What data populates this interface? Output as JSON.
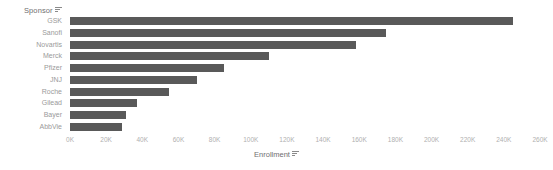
{
  "chart_data": {
    "type": "bar",
    "orientation": "horizontal",
    "title": "",
    "xlabel": "Enrollment",
    "ylabel": "Sponsor",
    "categories": [
      "GSK",
      "Sanofi",
      "Novartis",
      "Merck",
      "Pfizer",
      "JNJ",
      "Roche",
      "Gilead",
      "Bayer",
      "AbbVie"
    ],
    "values": [
      245000,
      175000,
      158000,
      110000,
      85000,
      70000,
      55000,
      37000,
      31000,
      29000
    ],
    "value_labels": [
      "245K",
      "175K",
      "158K",
      "110K",
      "85K",
      "70K",
      "55K",
      "37K",
      "31K",
      "29K"
    ],
    "xlim": [
      0,
      260000
    ],
    "xticks": [
      0,
      20000,
      40000,
      60000,
      80000,
      100000,
      120000,
      140000,
      160000,
      180000,
      200000,
      220000,
      240000,
      260000
    ],
    "xticklabels": [
      "0K",
      "20K",
      "40K",
      "60K",
      "80K",
      "100K",
      "120K",
      "140K",
      "160K",
      "180K",
      "200K",
      "220K",
      "240K",
      "260K"
    ],
    "grid": false,
    "legend": null,
    "bar_color": "#595959",
    "background_color": "#ffffff"
  },
  "axes": {
    "y": {
      "title": "Sponsor",
      "sort_icon": "sort-icon"
    },
    "x": {
      "title": "Enrollment",
      "sort_icon": "sort-icon"
    }
  },
  "colors": {
    "bar": "#595959",
    "tick_text": "#b0b0b0",
    "label_text": "#9a9a9a",
    "title_text": "#6f6f6f",
    "background": "#ffffff"
  }
}
